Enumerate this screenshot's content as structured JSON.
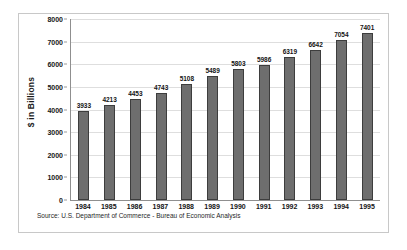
{
  "chart_data": {
    "type": "bar",
    "title": "",
    "xlabel": "",
    "ylabel": "$ in Billions",
    "categories": [
      "1984",
      "1985",
      "1986",
      "1987",
      "1988",
      "1989",
      "1990",
      "1991",
      "1992",
      "1993",
      "1994",
      "1995"
    ],
    "values": [
      3933,
      4213,
      4453,
      4743,
      5108,
      5489,
      5803,
      5986,
      6319,
      6642,
      7054,
      7401
    ],
    "data_labels": [
      "3933",
      "4213",
      "4453",
      "4743",
      "5108",
      "5489",
      "5803",
      "5986",
      "6319",
      "6642",
      "7054",
      "7401"
    ],
    "ylim": [
      0,
      8000
    ],
    "yticks": [
      0,
      1000,
      2000,
      3000,
      4000,
      5000,
      6000,
      7000,
      8000
    ],
    "ytick_labels": [
      "0",
      "1000",
      "2000",
      "3000",
      "4000",
      "5000",
      "6000",
      "7000",
      "8000"
    ],
    "grid": true,
    "legend": "none",
    "bar_color": "#6e6e6e",
    "bar_border_color": "#3d3d3d",
    "gridline_color": "#dedede",
    "axis_color": "#8f8f8f",
    "frame_color": "#c8c8c8"
  },
  "footer": {
    "source": "Source: U.S. Department of Commerce - Bureau of Economic Analysis"
  }
}
